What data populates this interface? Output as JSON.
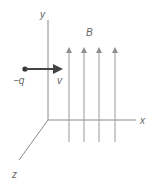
{
  "diagram": {
    "axes": {
      "x_label": "x",
      "y_label": "y",
      "z_label": "z",
      "color": "#8a8a8a"
    },
    "field": {
      "label": "B",
      "line_count": 4,
      "direction": "+y",
      "color": "#9a9a9a"
    },
    "charge": {
      "label": "−q",
      "color": "#333333"
    },
    "velocity": {
      "label": "v",
      "direction": "+x",
      "color": "#444444"
    }
  }
}
